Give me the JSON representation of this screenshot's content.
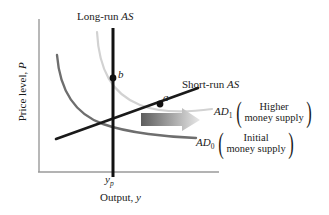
{
  "figure": {
    "type": "aggregate-supply-aggregate-demand-diagram",
    "axes": {
      "y_label_text": "Price level, ",
      "y_label_symbol": "P",
      "x_label_text": "Output, ",
      "x_label_symbol": "y",
      "x_tick_label": "y",
      "x_tick_subscript": "p"
    },
    "curves": {
      "lras": {
        "label_text": "Long-run ",
        "label_symbol": "AS",
        "color": "#111111"
      },
      "sras": {
        "label_text": "Short-run ",
        "label_symbol": "AS",
        "color": "#1a1a1a"
      },
      "ad0": {
        "label_symbol": "AD",
        "label_subscript": "0",
        "color": "#6e6e6e"
      },
      "ad1": {
        "label_symbol": "AD",
        "label_subscript": "1",
        "color": "#d2d2d2"
      }
    },
    "points": [
      {
        "name": "b",
        "label": "b"
      },
      {
        "name": "a",
        "label": "a"
      }
    ],
    "annotations": {
      "ad1_bracket": {
        "line1": "Higher",
        "line2": "money supply"
      },
      "ad0_bracket": {
        "line1": "Initial",
        "line2": "money supply"
      },
      "paren_open": "(",
      "paren_close": ")"
    },
    "shift_arrow": {
      "name": "rightward-shift-arrow",
      "color_start": "#5d5d5d",
      "color_end": "#e8e8e8"
    }
  }
}
